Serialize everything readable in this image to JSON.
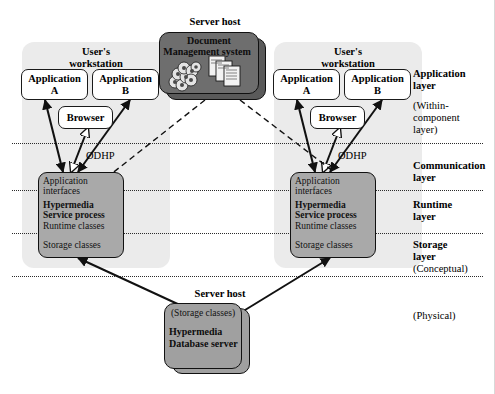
{
  "figure": {
    "colors": {
      "panel": "#ebebeb",
      "stack_box": "#a9a9a9",
      "server_box": "#6e6e6e",
      "db_box": "#a0a0a0",
      "line": "#1a1a1a"
    }
  },
  "workstation_left": {
    "title_line1": "User's",
    "title_line2": "workstation",
    "app_a_line1": "Application",
    "app_a_line2": "A",
    "app_b_line1": "Application",
    "app_b_line2": "B",
    "browser": "Browser",
    "protocol": "ODHP",
    "stack": [
      {
        "text": "Application",
        "bold": false
      },
      {
        "text": "interfaces",
        "bold": false
      },
      {
        "text": "Hypermedia",
        "bold": true
      },
      {
        "text": "Service process",
        "bold": true
      },
      {
        "text": "Runtime classes",
        "bold": false
      },
      {
        "text": "Storage classes",
        "bold": false
      }
    ]
  },
  "workstation_right": {
    "title_line1": "User's",
    "title_line2": "workstation",
    "app_a_line1": "Application",
    "app_a_line2": "A",
    "app_b_line1": "Application",
    "app_b_line2": "B",
    "browser": "Browser",
    "protocol": "ODHP",
    "stack": [
      {
        "text": "Application",
        "bold": false
      },
      {
        "text": "interfaces",
        "bold": false
      },
      {
        "text": "Hypermedia",
        "bold": true
      },
      {
        "text": "Service process",
        "bold": true
      },
      {
        "text": "Runtime classes",
        "bold": false
      },
      {
        "text": "Storage classes",
        "bold": false
      }
    ]
  },
  "server_top": {
    "host_label": "Server host",
    "name_line1": "Document",
    "name_line2": "Management system"
  },
  "server_bottom": {
    "host_label": "Server host",
    "storage_label": "(Storage classes)",
    "name_line1": "Hypermedia",
    "name_line2": "Database server"
  },
  "legend": {
    "application_layer_1": "Application",
    "application_layer_2": "layer",
    "within_component_1": "(Within-",
    "within_component_2": "component",
    "within_component_3": "layer)",
    "communication_layer_1": "Communication",
    "communication_layer_2": "layer",
    "runtime_layer_1": "Runtime",
    "runtime_layer_2": "layer",
    "storage_layer_1": "Storage",
    "storage_layer_2": "layer",
    "conceptual": "(Conceptual)",
    "physical": "(Physical)"
  }
}
